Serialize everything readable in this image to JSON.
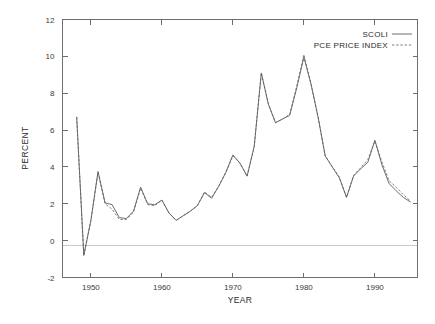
{
  "chart_data": {
    "type": "line",
    "title": "",
    "xlabel": "YEAR",
    "ylabel": "PERCENT",
    "xlim": [
      1946,
      1996
    ],
    "ylim": [
      -2,
      12
    ],
    "xticks": [
      1950,
      1960,
      1970,
      1980,
      1990
    ],
    "yticks": [
      -2,
      0,
      2,
      4,
      6,
      8,
      10,
      12
    ],
    "grid": false,
    "legend_position": "top-right",
    "x": [
      1948,
      1949,
      1950,
      1951,
      1952,
      1953,
      1954,
      1955,
      1956,
      1957,
      1958,
      1959,
      1960,
      1961,
      1962,
      1963,
      1964,
      1965,
      1966,
      1967,
      1968,
      1969,
      1970,
      1971,
      1972,
      1973,
      1974,
      1975,
      1976,
      1977,
      1978,
      1979,
      1980,
      1981,
      1982,
      1983,
      1984,
      1985,
      1986,
      1987,
      1988,
      1989,
      1990,
      1991,
      1992,
      1993,
      1994,
      1995
    ],
    "series": [
      {
        "name": "SCOLI",
        "style": "solid",
        "values": [
          6.7,
          -0.8,
          1.1,
          3.75,
          2.05,
          1.95,
          1.25,
          1.2,
          1.6,
          2.9,
          2.0,
          1.95,
          2.2,
          1.5,
          1.1,
          1.35,
          1.6,
          1.9,
          2.6,
          2.3,
          2.95,
          3.7,
          4.65,
          4.2,
          3.5,
          5.1,
          9.1,
          7.4,
          6.4,
          6.6,
          6.8,
          8.3,
          9.95,
          8.5,
          6.7,
          4.6,
          4.0,
          3.4,
          2.35,
          3.5,
          3.9,
          4.25,
          5.45,
          4.1,
          3.1,
          2.7,
          2.35,
          2.1
        ]
      },
      {
        "name": "PCE PRICE INDEX",
        "style": "dashed",
        "values": [
          6.7,
          -0.8,
          1.1,
          3.7,
          2.0,
          1.7,
          1.15,
          1.15,
          1.55,
          2.85,
          1.95,
          1.9,
          2.2,
          1.5,
          1.1,
          1.35,
          1.6,
          1.9,
          2.65,
          2.35,
          2.95,
          3.7,
          4.6,
          4.2,
          3.5,
          5.1,
          9.1,
          7.4,
          6.4,
          6.6,
          6.85,
          8.4,
          10.1,
          8.5,
          6.7,
          4.6,
          4.0,
          3.45,
          2.35,
          3.55,
          3.95,
          4.4,
          5.4,
          4.25,
          3.25,
          2.9,
          2.5,
          2.15
        ]
      }
    ]
  },
  "legend": {
    "entries": [
      {
        "label": "SCOLI",
        "style": "solid"
      },
      {
        "label": "PCE PRICE INDEX",
        "style": "dashed"
      }
    ]
  },
  "axes": {
    "y_label": "PERCENT",
    "x_label": "YEAR",
    "y_tick_labels": [
      "12",
      "10",
      "8",
      "6",
      "4",
      "2",
      "0",
      "-2"
    ],
    "x_tick_labels": [
      "1950",
      "1960",
      "1970",
      "1980",
      "1990"
    ]
  },
  "colors": {
    "line": "#5e5e5e",
    "axis": "#6e6e6e",
    "zero_rule": "#c9c9c9",
    "text": "#2b2b2b",
    "background": "#ffffff"
  }
}
